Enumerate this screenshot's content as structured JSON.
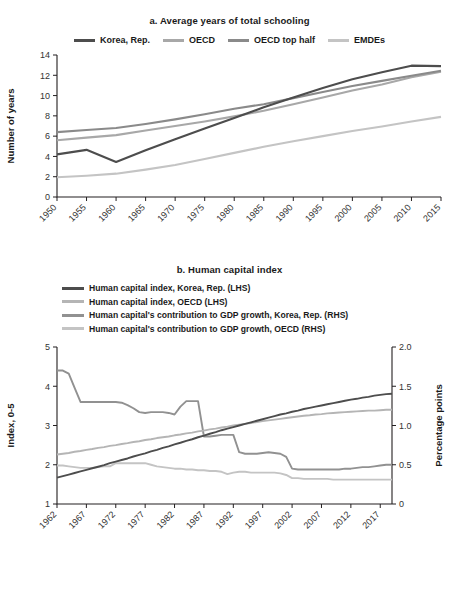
{
  "figure": {
    "panel_a_title": "a. Average years of total schooling",
    "panel_b_title": "b. Human capital index"
  },
  "colors": {
    "korea": "#4d4d4d",
    "oecd": "#a8a8a8",
    "oecd_top_half": "#8a8a8a",
    "emdes": "#c4c4c4",
    "hci_korea": "#4d4d4d",
    "hci_oecd": "#b5b5b5",
    "gdp_korea": "#919191",
    "gdp_oecd": "#c4c4c4",
    "axis": "#231f20",
    "text": "#1a1a1a"
  },
  "panel_a": {
    "legend": [
      {
        "label": "Korea, Rep.",
        "color_key": "korea"
      },
      {
        "label": "OECD",
        "color_key": "oecd"
      },
      {
        "label": "OECD top half",
        "color_key": "oecd_top_half"
      },
      {
        "label": "EMDEs",
        "color_key": "emdes"
      }
    ]
  },
  "panel_b": {
    "legend": [
      {
        "label": "Human capital index, Korea, Rep. (LHS)",
        "color_key": "hci_korea"
      },
      {
        "label": "Human capital index, OECD (LHS)",
        "color_key": "hci_oecd"
      },
      {
        "label": "Human capital's contribution to GDP growth, Korea, Rep. (RHS)",
        "color_key": "gdp_korea"
      },
      {
        "label": "Human capital's contribution to GDP growth, OECD (RHS)",
        "color_key": "gdp_oecd"
      }
    ]
  },
  "chart_data": [
    {
      "id": "panel-a",
      "type": "line",
      "title": "a. Average years of total schooling",
      "xlabel": "",
      "ylabel": "Number of years",
      "xlim": [
        1950,
        2015
      ],
      "ylim": [
        0,
        14
      ],
      "yticks": [
        0,
        2,
        4,
        6,
        8,
        10,
        12,
        14
      ],
      "xticks": [
        1950,
        1955,
        1960,
        1965,
        1970,
        1975,
        1980,
        1985,
        1990,
        1995,
        2000,
        2005,
        2010,
        2015
      ],
      "grid": false,
      "legend_position": "top",
      "x": [
        1950,
        1955,
        1960,
        1965,
        1970,
        1975,
        1980,
        1985,
        1990,
        1995,
        2000,
        2005,
        2010,
        2015
      ],
      "series": [
        {
          "name": "Korea, Rep.",
          "color": "#4d4d4d",
          "values": [
            4.2,
            4.65,
            3.45,
            4.6,
            5.7,
            6.75,
            7.8,
            8.85,
            9.8,
            10.75,
            11.6,
            12.3,
            12.95,
            12.9
          ]
        },
        {
          "name": "OECD",
          "color": "#a8a8a8",
          "values": [
            5.6,
            5.85,
            6.1,
            6.55,
            7.0,
            7.45,
            7.95,
            8.5,
            9.15,
            9.8,
            10.5,
            11.1,
            11.8,
            12.35
          ]
        },
        {
          "name": "OECD top half",
          "color": "#8a8a8a",
          "values": [
            6.4,
            6.6,
            6.8,
            7.2,
            7.65,
            8.15,
            8.7,
            9.15,
            9.75,
            10.35,
            10.95,
            11.45,
            11.95,
            12.45
          ]
        },
        {
          "name": "EMDEs",
          "color": "#c4c4c4",
          "values": [
            1.95,
            2.1,
            2.3,
            2.7,
            3.15,
            3.75,
            4.35,
            4.95,
            5.5,
            6.0,
            6.5,
            6.95,
            7.45,
            7.9
          ]
        }
      ]
    },
    {
      "id": "panel-b",
      "type": "line",
      "title": "b. Human capital index",
      "xlabel": "",
      "ylabel": "Index, 0-5",
      "ylabel_right": "Percentage points",
      "xlim": [
        1962,
        2019
      ],
      "ylim": [
        1,
        5
      ],
      "yticks": [
        1,
        2,
        3,
        4,
        5
      ],
      "ylim_right": [
        0,
        2.0
      ],
      "yticks_right": [
        0,
        0.5,
        1.0,
        1.5,
        2.0
      ],
      "xticks": [
        1962,
        1967,
        1972,
        1977,
        1982,
        1987,
        1992,
        1997,
        2002,
        2007,
        2012,
        2017
      ],
      "grid": false,
      "legend_position": "top",
      "x": [
        1962,
        1963,
        1964,
        1965,
        1966,
        1967,
        1968,
        1969,
        1970,
        1971,
        1972,
        1973,
        1974,
        1975,
        1976,
        1977,
        1978,
        1979,
        1980,
        1981,
        1982,
        1983,
        1984,
        1985,
        1986,
        1987,
        1988,
        1989,
        1990,
        1991,
        1992,
        1993,
        1994,
        1995,
        1996,
        1997,
        1998,
        1999,
        2000,
        2001,
        2002,
        2003,
        2004,
        2005,
        2006,
        2007,
        2008,
        2009,
        2010,
        2011,
        2012,
        2013,
        2014,
        2015,
        2016,
        2017,
        2018,
        2019
      ],
      "series": [
        {
          "name": "Human capital index, Korea, Rep. (LHS)",
          "axis": "left",
          "color": "#4d4d4d",
          "values": [
            1.67,
            1.71,
            1.75,
            1.79,
            1.83,
            1.87,
            1.91,
            1.95,
            1.99,
            2.04,
            2.08,
            2.12,
            2.16,
            2.21,
            2.25,
            2.29,
            2.34,
            2.38,
            2.43,
            2.47,
            2.52,
            2.56,
            2.61,
            2.65,
            2.7,
            2.74,
            2.79,
            2.83,
            2.88,
            2.92,
            2.96,
            3.0,
            3.04,
            3.08,
            3.12,
            3.16,
            3.2,
            3.24,
            3.28,
            3.31,
            3.35,
            3.38,
            3.42,
            3.45,
            3.48,
            3.51,
            3.54,
            3.57,
            3.6,
            3.63,
            3.66,
            3.68,
            3.71,
            3.73,
            3.76,
            3.78,
            3.8,
            3.81
          ]
        },
        {
          "name": "Human capital index, OECD (LHS)",
          "axis": "left",
          "color": "#b5b5b5",
          "values": [
            2.26,
            2.28,
            2.3,
            2.33,
            2.35,
            2.38,
            2.4,
            2.43,
            2.45,
            2.48,
            2.5,
            2.53,
            2.55,
            2.58,
            2.6,
            2.63,
            2.65,
            2.68,
            2.7,
            2.72,
            2.75,
            2.77,
            2.8,
            2.82,
            2.85,
            2.87,
            2.9,
            2.92,
            2.95,
            2.97,
            3.0,
            3.02,
            3.04,
            3.06,
            3.09,
            3.11,
            3.13,
            3.15,
            3.17,
            3.19,
            3.21,
            3.23,
            3.25,
            3.26,
            3.28,
            3.29,
            3.31,
            3.32,
            3.33,
            3.34,
            3.35,
            3.36,
            3.37,
            3.38,
            3.38,
            3.39,
            3.4,
            3.4
          ]
        },
        {
          "name": "Human capital's contribution to GDP growth, Korea, Rep. (RHS)",
          "axis": "right",
          "color": "#919191",
          "values": [
            1.7,
            1.7,
            1.66,
            1.48,
            1.3,
            1.3,
            1.3,
            1.3,
            1.3,
            1.3,
            1.3,
            1.29,
            1.26,
            1.22,
            1.17,
            1.16,
            1.17,
            1.17,
            1.17,
            1.16,
            1.14,
            1.24,
            1.31,
            1.31,
            1.31,
            0.86,
            0.86,
            0.87,
            0.88,
            0.88,
            0.88,
            0.66,
            0.64,
            0.64,
            0.64,
            0.65,
            0.66,
            0.65,
            0.64,
            0.6,
            0.45,
            0.44,
            0.44,
            0.44,
            0.44,
            0.44,
            0.44,
            0.44,
            0.44,
            0.45,
            0.45,
            0.46,
            0.47,
            0.47,
            0.48,
            0.49,
            0.5,
            0.5
          ]
        },
        {
          "name": "Human capital's contribution to GDP growth, OECD (RHS)",
          "axis": "right",
          "color": "#c4c4c4",
          "values": [
            0.49,
            0.49,
            0.48,
            0.47,
            0.46,
            0.46,
            0.46,
            0.47,
            0.48,
            0.48,
            0.52,
            0.52,
            0.52,
            0.52,
            0.52,
            0.52,
            0.5,
            0.48,
            0.47,
            0.46,
            0.45,
            0.45,
            0.44,
            0.44,
            0.43,
            0.43,
            0.42,
            0.42,
            0.41,
            0.38,
            0.4,
            0.41,
            0.41,
            0.4,
            0.4,
            0.4,
            0.4,
            0.4,
            0.39,
            0.37,
            0.33,
            0.33,
            0.32,
            0.32,
            0.32,
            0.32,
            0.32,
            0.31,
            0.31,
            0.31,
            0.31,
            0.31,
            0.31,
            0.31,
            0.31,
            0.31,
            0.31,
            0.31
          ]
        }
      ]
    }
  ]
}
